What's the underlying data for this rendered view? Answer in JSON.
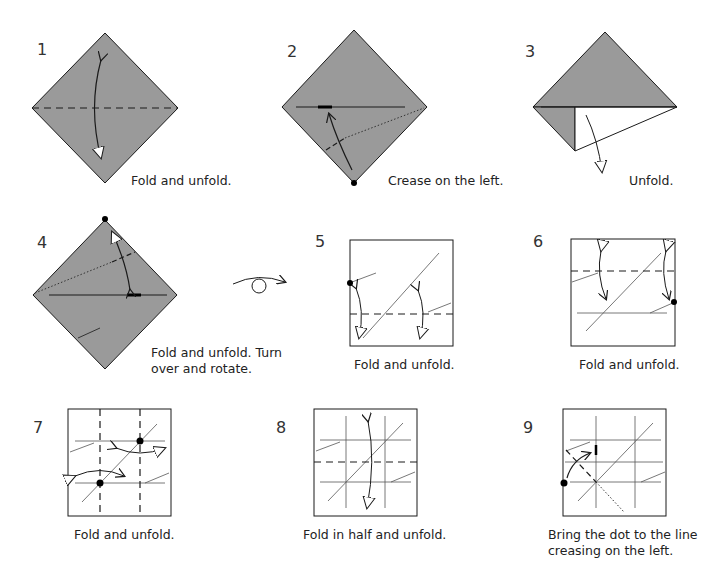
{
  "diagram": {
    "paper_color": "#9a9a9a",
    "line_color": "#1a1a1a",
    "crease_color": "#555555",
    "steps": [
      {
        "number": "1",
        "caption": "Fold and unfold."
      },
      {
        "number": "2",
        "caption": "Crease on the left."
      },
      {
        "number": "3",
        "caption": "Unfold."
      },
      {
        "number": "4",
        "caption_line1": "Fold and unfold. Turn",
        "caption_line2": "over and rotate."
      },
      {
        "number": "5",
        "caption": "Fold and unfold."
      },
      {
        "number": "6",
        "caption": "Fold and unfold."
      },
      {
        "number": "7",
        "caption": "Fold and unfold."
      },
      {
        "number": "8",
        "caption": "Fold in half and unfold."
      },
      {
        "number": "9",
        "caption_line1": "Bring the dot to the line",
        "caption_line2": "creasing on the left."
      }
    ],
    "symbols": {
      "turn_over": "turn-over-symbol"
    }
  }
}
